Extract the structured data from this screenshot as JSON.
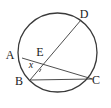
{
  "figure": {
    "kind": "circle-geometry-diagram",
    "background_color": "#ffffff",
    "stroke_color": "#3a3a3a",
    "label_color": "#1a1a1a",
    "circle": {
      "cx": 57.5,
      "cy": 52.5,
      "r": 39.5,
      "stroke_width": 1.3
    },
    "points": [
      {
        "id": "A",
        "label": "A",
        "x": 22.0,
        "y": 58.0,
        "label_x": 10.0,
        "label_y": 59.0
      },
      {
        "id": "B",
        "label": "B",
        "x": 30.0,
        "y": 80.0,
        "label_x": 19.0,
        "label_y": 85.0
      },
      {
        "id": "C",
        "label": "C",
        "x": 92.5,
        "y": 79.0,
        "label_x": 96.0,
        "label_y": 84.0
      },
      {
        "id": "D",
        "label": "D",
        "x": 81.0,
        "y": 20.0,
        "label_x": 84.0,
        "label_y": 18.0
      },
      {
        "id": "E",
        "label": "E",
        "x": 41.0,
        "y": 60.5,
        "label_x": 40.0,
        "label_y": 56.0
      }
    ],
    "segments": [
      {
        "id": "AC",
        "from": "A",
        "to": "C",
        "stroke_width": 0.9
      },
      {
        "id": "BD",
        "from": "B",
        "to": "D",
        "stroke_width": 0.9
      },
      {
        "id": "BC",
        "from": "B",
        "to": "C",
        "stroke_width": 0.9
      }
    ],
    "angle_marker": {
      "id": "x",
      "label": "x",
      "at_point": "B",
      "between": [
        "BE",
        "BC"
      ],
      "label_x": 31.0,
      "label_y": 68.0,
      "arc_radius": 11.0
    }
  }
}
